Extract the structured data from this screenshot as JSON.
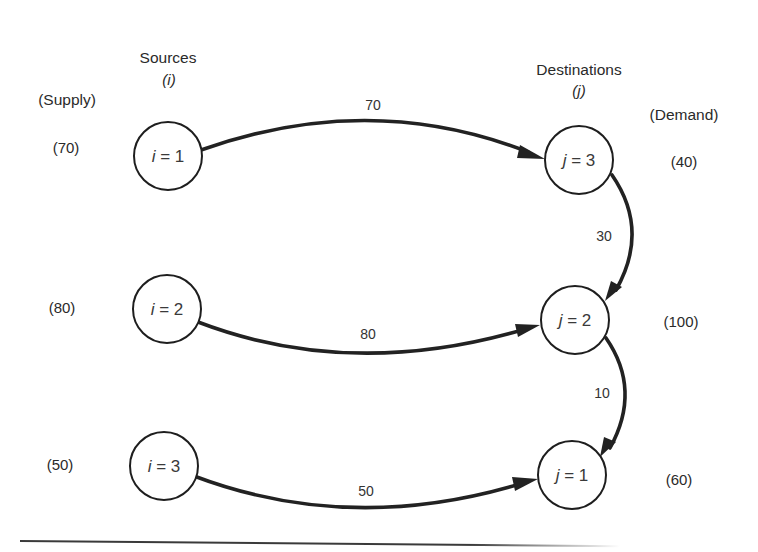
{
  "figure": {
    "type": "transportation-network",
    "headers": {
      "sources_title": "Sources",
      "sources_index": "(i)",
      "destinations_title": "Destinations",
      "destinations_index": "(j)",
      "supply_label": "(Supply)",
      "demand_label": "(Demand)"
    },
    "sources": [
      {
        "id": "i1",
        "var": "i",
        "eq": " = 1",
        "supply": "(70)"
      },
      {
        "id": "i2",
        "var": "i",
        "eq": " = 2",
        "supply": "(80)"
      },
      {
        "id": "i3",
        "var": "i",
        "eq": " = 3",
        "supply": "(50)"
      }
    ],
    "destinations": [
      {
        "id": "j3",
        "var": "j",
        "eq": " = 3",
        "demand": "(40)"
      },
      {
        "id": "j2",
        "var": "j",
        "eq": " = 2",
        "demand": "(100)"
      },
      {
        "id": "j1",
        "var": "j",
        "eq": " = 1",
        "demand": "(60)"
      }
    ],
    "flows": [
      {
        "from": "i = 1",
        "to": "j = 3",
        "amount": "70"
      },
      {
        "from": "i = 2",
        "to": "j = 2",
        "amount": "80"
      },
      {
        "from": "i = 3",
        "to": "j = 1",
        "amount": "50"
      },
      {
        "from": "j = 3",
        "to": "j = 2",
        "amount": "30"
      },
      {
        "from": "j = 2",
        "to": "j = 1",
        "amount": "10"
      }
    ],
    "colors": {
      "line": "#222222",
      "text": "#2a2a2a",
      "background": "#ffffff"
    }
  }
}
